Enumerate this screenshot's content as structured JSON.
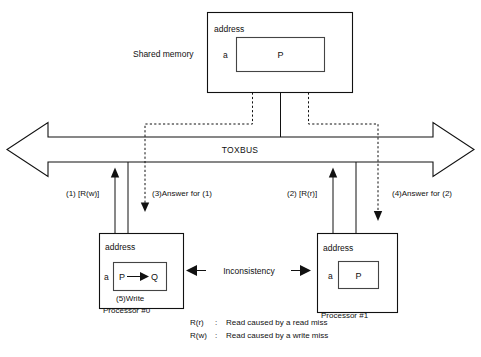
{
  "diagram": {
    "title_hidden": "Cache coherence inconsistency on TOXBUS",
    "shared_memory": {
      "side_label": "Shared memory",
      "address_label": "address",
      "tag_label": "a",
      "block_value": "P"
    },
    "bus": {
      "label": "TOXBUS"
    },
    "transactions": [
      {
        "id": "t1",
        "label": "(1) [R(w)]"
      },
      {
        "id": "t3",
        "label": "(3)Answer for (1)"
      },
      {
        "id": "t2",
        "label": "(2) [R(r)]"
      },
      {
        "id": "t4",
        "label": "(4)Answer for  (2)"
      }
    ],
    "processor0": {
      "address_label": "address",
      "tag_label": "a",
      "block_from": "P",
      "block_to": "Q",
      "write_label": "(5)Write",
      "name": "Processor  #0"
    },
    "processor1": {
      "address_label": "address",
      "tag_label": "a",
      "block_value": "P",
      "name": "Processor  #1"
    },
    "inconsistency": {
      "label": "Inconsistency"
    },
    "legend": [
      {
        "term": "R(r)",
        "sep": ":",
        "definition": "Read caused by a read miss"
      },
      {
        "term": "R(w)",
        "sep": ":",
        "definition": "Read caused by a write miss"
      }
    ]
  }
}
